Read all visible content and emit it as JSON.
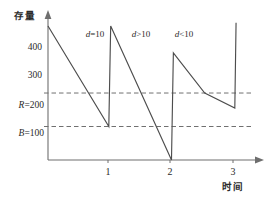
{
  "chart_data": {
    "type": "line",
    "title": "",
    "xlabel": "时间",
    "ylabel": "存量",
    "xlim": [
      0,
      3.35
    ],
    "ylim": [
      0,
      430
    ],
    "grid": false,
    "legend_position": "none",
    "x_ticks": [
      "1",
      "2",
      "3"
    ],
    "x_tick_values": [
      1,
      2,
      3
    ],
    "y_ticks": [
      "400",
      "300"
    ],
    "y_tick_values": [
      400,
      300
    ],
    "threshold_lines": [
      {
        "name": "reorder-point",
        "label_symbol": "R",
        "label_equals": "=",
        "label_value": "200",
        "value": 200,
        "style": "dashed"
      },
      {
        "name": "safety-stock",
        "label_symbol": "B",
        "label_equals": "=",
        "label_value": "100",
        "value": 100,
        "style": "dashed"
      }
    ],
    "annotations": [
      {
        "name": "demand-equal",
        "text": "d=10",
        "symbol": "d",
        "relation": "=",
        "value": "10",
        "x": 1.25,
        "y": 400
      },
      {
        "name": "demand-greater",
        "text": "d>10",
        "symbol": "d",
        "relation": ">",
        "value": "10",
        "x": 1.95,
        "y": 400
      },
      {
        "name": "demand-less",
        "text": "d<10",
        "symbol": "d",
        "relation": "<",
        "value": "10",
        "x": 2.55,
        "y": 400
      }
    ],
    "series": [
      {
        "name": "inventory-level",
        "color": "#4d4d4d",
        "points": [
          [
            0.0,
            400
          ],
          [
            0.97,
            100
          ],
          [
            1.0,
            400
          ],
          [
            1.97,
            0
          ],
          [
            2.0,
            320
          ],
          [
            2.5,
            200
          ],
          [
            2.98,
            155
          ],
          [
            3.0,
            410
          ]
        ]
      }
    ]
  },
  "axis": {
    "y_label": "存量",
    "x_label": "时间"
  },
  "ticks": {
    "y": [
      {
        "label": "400"
      },
      {
        "label": "300"
      }
    ],
    "x": [
      {
        "label": "1"
      },
      {
        "label": "2"
      },
      {
        "label": "3"
      }
    ]
  },
  "thresholds": {
    "reorder": {
      "symbol": "R",
      "eq": "=",
      "value": "200"
    },
    "safety": {
      "symbol": "B",
      "eq": "=",
      "value": "100"
    }
  },
  "annotations": {
    "a1": {
      "symbol": "d",
      "rel": "=",
      "value": "10"
    },
    "a2": {
      "symbol": "d",
      "rel": ">",
      "value": "10"
    },
    "a3": {
      "symbol": "d",
      "rel": "<",
      "value": "10"
    }
  },
  "colors": {
    "line": "#4d4d4d",
    "axis": "#6e6e6e",
    "dash": "#707070",
    "text": "#2b2b2b"
  }
}
